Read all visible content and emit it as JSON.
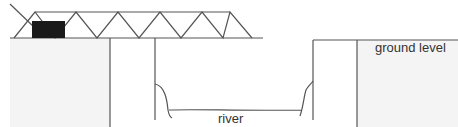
{
  "diagram": {
    "labels": {
      "ground_level": "ground level",
      "river": "river"
    },
    "colors": {
      "ground_fill": "#f4f4f4",
      "line": "#555555",
      "truck": "#1a1a1a"
    }
  }
}
